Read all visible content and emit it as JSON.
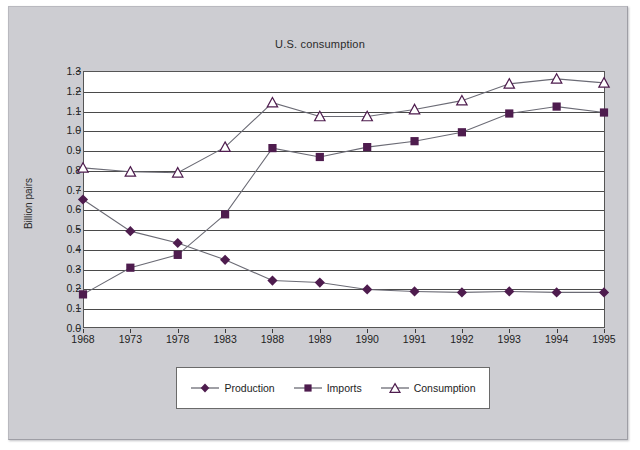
{
  "chart_data": {
    "type": "line",
    "title": "U.S. consumption",
    "xlabel": "",
    "ylabel": "Billion pairs",
    "categories": [
      "1968",
      "1973",
      "1978",
      "1983",
      "1988",
      "1989",
      "1990",
      "1991",
      "1992",
      "1993",
      "1994",
      "1995"
    ],
    "ylim": [
      0.0,
      1.3
    ],
    "ytick_labels": [
      "1.3",
      "1.2",
      "1.1",
      "1.0",
      "0.9",
      "0.8",
      "0.7",
      "0.6",
      "0.5",
      "0.4",
      "0.3",
      "0.2",
      "0.1",
      "0.0"
    ],
    "ytick_values": [
      1.3,
      1.2,
      1.1,
      1.0,
      0.9,
      0.8,
      0.7,
      0.6,
      0.5,
      0.4,
      0.3,
      0.2,
      0.1,
      0.0
    ],
    "grid": true,
    "legend_position": "bottom",
    "series": [
      {
        "name": "Production",
        "marker": "diamond-filled",
        "color": "#4e1c4e",
        "values": [
          0.65,
          0.49,
          0.43,
          0.345,
          0.24,
          0.23,
          0.195,
          0.185,
          0.18,
          0.185,
          0.18,
          0.18
        ]
      },
      {
        "name": "Imports",
        "marker": "square-filled",
        "color": "#4e1c4e",
        "values": [
          0.17,
          0.305,
          0.37,
          0.575,
          0.91,
          0.865,
          0.915,
          0.945,
          0.99,
          1.085,
          1.12,
          1.09
        ]
      },
      {
        "name": "Consumption",
        "marker": "triangle-open",
        "color": "#4e1c4e",
        "values": [
          0.81,
          0.79,
          0.785,
          0.915,
          1.14,
          1.07,
          1.07,
          1.105,
          1.15,
          1.235,
          1.26,
          1.24
        ]
      }
    ]
  },
  "legend": {
    "items": [
      {
        "label": "Production"
      },
      {
        "label": "Imports"
      },
      {
        "label": "Consumption"
      }
    ]
  },
  "colors": {
    "series": "#4e1c4e",
    "line": "#6b6b75",
    "plot_background": "#ffffff",
    "page_background": "#cdcdd2",
    "axis": "#4a4a4a"
  }
}
